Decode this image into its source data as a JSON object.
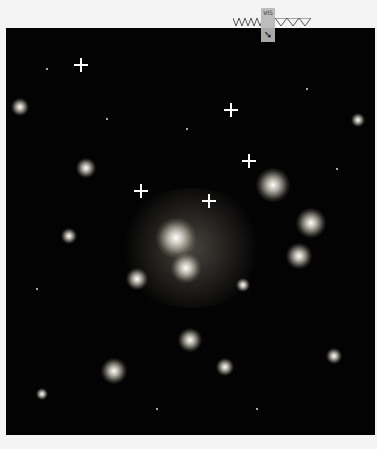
{
  "image": {
    "subject": "deep field galaxy cluster",
    "background_color": "#030303",
    "page_background": "#f4f4f4"
  },
  "overlay": {
    "label": "VIS",
    "icon": "pointer-arrow-icon"
  }
}
